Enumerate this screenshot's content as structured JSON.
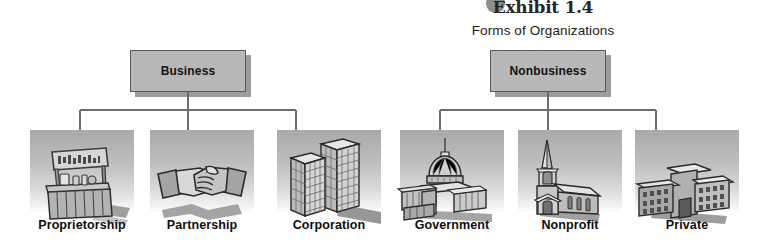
{
  "header": {
    "exhibit_label": "Exhibit 1.4",
    "subtitle": "Forms of Organizations",
    "badge_color": "#8e8e8e"
  },
  "colors": {
    "box_fill": "#b8b8b8",
    "box_border": "#59595b",
    "box_shadow": "#9c9c9c",
    "line": "#6e6e6e",
    "panel_top": "#a9a9a9",
    "panel_bottom": "#fdfdfd",
    "text": "#111111"
  },
  "branches": [
    {
      "id": "business",
      "node_label": "Business",
      "children": [
        "Proprietorship",
        "Partnership",
        "Corporation"
      ]
    },
    {
      "id": "nonbusiness",
      "node_label": "Nonbusiness",
      "children": [
        "Government",
        "Nonprofit",
        "Private"
      ]
    }
  ],
  "cells": [
    {
      "label": "Proprietorship",
      "icon": "lemonade-stand-icon",
      "sign_text": "LEMONADE"
    },
    {
      "label": "Partnership",
      "icon": "handshake-icon",
      "sign_text": ""
    },
    {
      "label": "Corporation",
      "icon": "skyscrapers-icon",
      "sign_text": ""
    },
    {
      "label": "Government",
      "icon": "capitol-building-icon",
      "sign_text": ""
    },
    {
      "label": "Nonprofit",
      "icon": "church-icon",
      "sign_text": ""
    },
    {
      "label": "Private",
      "icon": "institution-building-icon",
      "sign_text": ""
    }
  ]
}
